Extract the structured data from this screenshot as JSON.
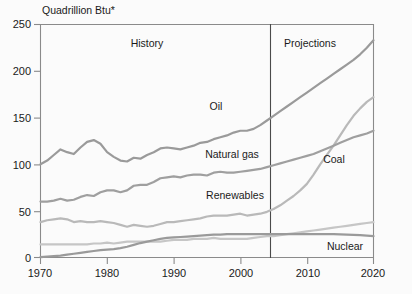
{
  "chart_data": {
    "type": "line",
    "title": "",
    "unit_label": "Quadrillion Btu*",
    "xlabel": "",
    "ylabel": "Quadrillion Btu*",
    "xlim": [
      1970,
      2020
    ],
    "ylim": [
      0,
      250
    ],
    "xticks": [
      1970,
      1980,
      1990,
      2000,
      2010,
      2020
    ],
    "xtick_labels": [
      "1970",
      "1980",
      "1990",
      "2000",
      "2010",
      "2020"
    ],
    "yticks": [
      0,
      50,
      100,
      150,
      200,
      250
    ],
    "ytick_labels": [
      "0",
      "50",
      "100",
      "150",
      "200",
      "250"
    ],
    "grid": false,
    "legend_position": "inline-annotations",
    "annotations": [
      {
        "text": "History",
        "x": 1986,
        "y": 236
      },
      {
        "text": "Projections",
        "x": 2010,
        "y": 236
      },
      {
        "text": "Oil",
        "x": 1989,
        "y": 158
      },
      {
        "text": "Natural gas",
        "x": 1988,
        "y": 117
      },
      {
        "text": "Renewables",
        "x": 1988,
        "y": 55
      },
      {
        "text": "Coal",
        "x": 2012,
        "y": 107
      },
      {
        "text": "Nuclear",
        "x": 2014,
        "y": 17
      }
    ],
    "divider": {
      "x": 2002.5,
      "label_left": "History",
      "label_right": "Projections"
    },
    "x": [
      1970,
      1971,
      1972,
      1973,
      1974,
      1975,
      1976,
      1977,
      1978,
      1979,
      1980,
      1981,
      1982,
      1983,
      1984,
      1985,
      1986,
      1987,
      1988,
      1989,
      1990,
      1991,
      1992,
      1993,
      1994,
      1995,
      1996,
      1997,
      1998,
      1999,
      2000,
      2001,
      2002,
      2003,
      2004,
      2005,
      2006,
      2007,
      2008,
      2009,
      2010,
      2011,
      2012,
      2013,
      2014,
      2015,
      2016,
      2017,
      2018,
      2019,
      2020
    ],
    "series": [
      {
        "name": "Oil",
        "color": "#9a9a9a",
        "values": [
          100,
          104,
          110,
          116,
          113,
          111,
          118,
          124,
          126,
          122,
          113,
          108,
          104,
          103,
          107,
          106,
          110,
          113,
          117,
          118,
          117,
          116,
          118,
          120,
          123,
          124,
          127,
          129,
          131,
          134,
          136,
          136,
          138,
          142,
          147,
          152,
          157,
          162,
          167,
          172,
          177,
          182,
          187,
          192,
          197,
          202,
          207,
          212,
          218,
          225,
          233
        ]
      },
      {
        "name": "Natural gas",
        "color": "#b9b9b9",
        "values": [
          38,
          40,
          41,
          42,
          41,
          38,
          39,
          38,
          38,
          39,
          38,
          37,
          35,
          33,
          35,
          34,
          33,
          34,
          36,
          38,
          38,
          39,
          40,
          41,
          42,
          44,
          45,
          45,
          45,
          46,
          47,
          45,
          46,
          47,
          49,
          52,
          56,
          61,
          66,
          72,
          79,
          89,
          100,
          110,
          120,
          131,
          142,
          152,
          160,
          167,
          172
        ]
      },
      {
        "name": "Coal",
        "color": "#9f9f9f",
        "values": [
          60,
          60,
          61,
          63,
          61,
          62,
          65,
          67,
          66,
          70,
          72,
          72,
          70,
          72,
          77,
          78,
          78,
          81,
          85,
          86,
          87,
          86,
          88,
          89,
          89,
          88,
          91,
          92,
          91,
          91,
          92,
          93,
          94,
          95,
          97,
          99,
          101,
          103,
          105,
          107,
          109,
          111,
          114,
          117,
          120,
          123,
          126,
          129,
          131,
          133,
          136
        ]
      },
      {
        "name": "Renewables",
        "color": "#c6c6c6",
        "values": [
          14,
          14,
          14,
          14,
          14,
          14,
          14,
          14,
          15,
          15,
          16,
          15,
          16,
          17,
          17,
          17,
          17,
          17,
          17,
          18,
          19,
          19,
          19,
          20,
          20,
          20,
          21,
          20,
          20,
          20,
          20,
          20,
          21,
          22,
          23,
          23,
          24,
          25,
          26,
          27,
          28,
          29,
          30,
          31,
          32,
          33,
          34,
          35,
          36,
          37,
          38
        ]
      },
      {
        "name": "Nuclear",
        "color": "#9a9a9a",
        "values": [
          0.3,
          0.5,
          0.8,
          1.2,
          1.8,
          2.5,
          3.0,
          3.5,
          4.0,
          3.6,
          3.5,
          3.7,
          3.9,
          4.2,
          5.0,
          6.0,
          6.5,
          7.2,
          8.0,
          8.0,
          8.5,
          9.0,
          9.2,
          9.5,
          9.8,
          10.0,
          10.2,
          10.0,
          10.5,
          10.8,
          11.0,
          11.0,
          11.0,
          11.0,
          11.0,
          11.0,
          11.0,
          11.0,
          11.0,
          11.0,
          11.0,
          11.0,
          11.0,
          11.0,
          11.0,
          11.0,
          10.8,
          10.5,
          10.2,
          10.0,
          9.8
        ]
      }
    ],
    "nuclear_baseline_note": "Nuclear line plotted near 25 on chart after mid-1980s",
    "nuclear_plot_values": [
      0.5,
      1.0,
      1.5,
      2.0,
      3.0,
      4.0,
      5.0,
      6.0,
      7.0,
      8.0,
      8.5,
      9.0,
      10.0,
      11.5,
      13.5,
      15.5,
      17.0,
      18.5,
      20.0,
      21.0,
      21.5,
      22.0,
      22.5,
      23.0,
      23.5,
      24.0,
      24.5,
      24.5,
      25.0,
      25.0,
      25.0,
      25.0,
      25.0,
      25.0,
      25.0,
      25.0,
      25.0,
      25.0,
      25.0,
      25.0,
      25.0,
      25.0,
      25.0,
      25.0,
      25.0,
      24.8,
      24.5,
      24.2,
      24.0,
      23.5,
      23.0
    ]
  },
  "axis": {
    "unit": "Quadrillion Btu*"
  }
}
